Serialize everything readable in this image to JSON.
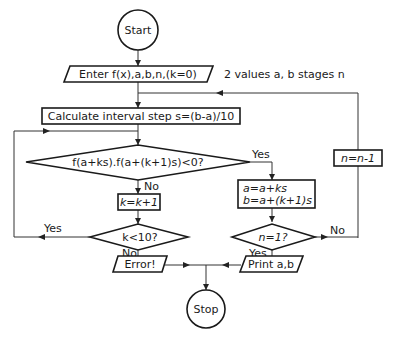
{
  "diagram": {
    "type": "flowchart",
    "title": "",
    "nodes": {
      "start": {
        "shape": "circle",
        "label": "Start"
      },
      "input": {
        "shape": "parallelogram",
        "label": "Enter f(x),a,b,n,(k=0)"
      },
      "calc": {
        "shape": "rectangle",
        "label": "Calculate interval step s=(b-a)/10"
      },
      "test_sign": {
        "shape": "diamond",
        "label": "f(a+ks).f(a+(k+1)s)<0?"
      },
      "incr_k": {
        "shape": "rectangle",
        "label": "k=k+1"
      },
      "test_k": {
        "shape": "diamond",
        "label": "k<10?"
      },
      "error": {
        "shape": "parallelogram",
        "label": "Error!"
      },
      "assign": {
        "shape": "rectangle",
        "label_line1": "a=a+ks",
        "label_line2": "b=a+(k+1)s"
      },
      "test_n": {
        "shape": "diamond",
        "label": "n=1?"
      },
      "decr_n": {
        "shape": "rectangle",
        "label": "n=n-1"
      },
      "print": {
        "shape": "parallelogram",
        "label": "Print a,b"
      },
      "stop": {
        "shape": "circle",
        "label": "Stop"
      }
    },
    "annotation": "2 values a, b  stages n",
    "edge_labels": {
      "sign_yes": "Yes",
      "sign_no": "No",
      "k_yes": "Yes",
      "k_no": "No",
      "n_yes": "Yes",
      "n_no": "No"
    },
    "edges": [
      {
        "from": "start",
        "to": "input"
      },
      {
        "from": "input",
        "to": "calc"
      },
      {
        "from": "calc",
        "to": "test_sign"
      },
      {
        "from": "test_sign",
        "to": "assign",
        "label": "Yes"
      },
      {
        "from": "test_sign",
        "to": "incr_k",
        "label": "No"
      },
      {
        "from": "incr_k",
        "to": "test_k"
      },
      {
        "from": "test_k",
        "to": "test_sign",
        "label": "Yes"
      },
      {
        "from": "test_k",
        "to": "error",
        "label": "No"
      },
      {
        "from": "assign",
        "to": "test_n"
      },
      {
        "from": "test_n",
        "to": "print",
        "label": "Yes"
      },
      {
        "from": "test_n",
        "to": "decr_n",
        "label": "No"
      },
      {
        "from": "decr_n",
        "to": "calc"
      },
      {
        "from": "error",
        "to": "stop"
      },
      {
        "from": "print",
        "to": "stop"
      }
    ]
  }
}
